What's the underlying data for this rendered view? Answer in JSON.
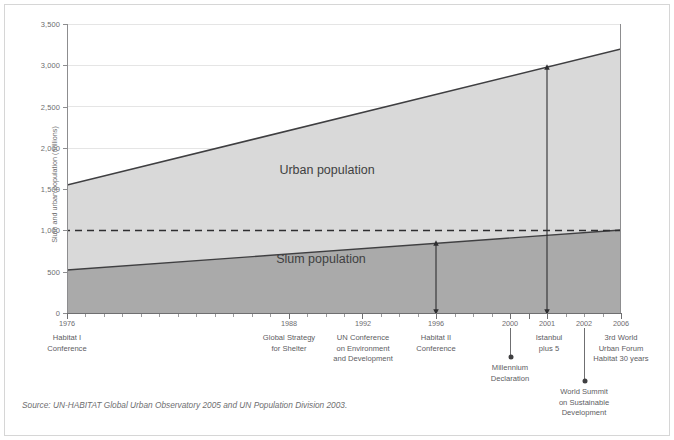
{
  "chart_data": {
    "type": "area",
    "title": "",
    "subtitle": "",
    "xlabel": "",
    "ylabel": "Slum and urban population (millions)",
    "xlim": [
      1976,
      2006
    ],
    "ylim": [
      0,
      3500
    ],
    "grid": true,
    "legend_position": "inline",
    "y_ticks": [
      0,
      500,
      1000,
      1500,
      2000,
      2500,
      3000,
      3500
    ],
    "y_tick_labels": [
      "0",
      "500",
      "1,000",
      "1,500",
      "2,000",
      "2,500",
      "3,000",
      "3,500"
    ],
    "x": [
      1976,
      2006
    ],
    "series": [
      {
        "name": "Urban population",
        "values": [
          1550,
          3200
        ]
      },
      {
        "name": "Slum population",
        "values": [
          520,
          1010
        ]
      }
    ],
    "reference_line": {
      "value": 1000,
      "style": "dashed",
      "label": ""
    },
    "annotations": [
      {
        "type": "vertical-arrow",
        "x": 1996,
        "from": 0,
        "to": 760,
        "note": "slum population at 1996"
      },
      {
        "type": "vertical-arrow",
        "x": 2002,
        "from": 0,
        "to": 3000,
        "note": "urban population at 2002"
      }
    ]
  },
  "axis": {
    "y_title": "Slum and urban population (millions)",
    "y_labels": [
      "3,500",
      "3,000",
      "2,500",
      "2,000",
      "1,500",
      "1,000",
      "500",
      "0"
    ],
    "x_year_labels": [
      "1976",
      "1988",
      "1992",
      "1996",
      "2000",
      "2001",
      "2002",
      "2006"
    ]
  },
  "series_labels": {
    "urban": "Urban population",
    "slum": "Slum population"
  },
  "milestones": [
    {
      "year": "1976",
      "lines": [
        "Habitat I",
        "Conference"
      ]
    },
    {
      "year": "1988",
      "lines": [
        "Global Strategy",
        "for Shelter"
      ]
    },
    {
      "year": "1992",
      "lines": [
        "UN Conference",
        "on Environment",
        "and Development"
      ]
    },
    {
      "year": "1996",
      "lines": [
        "Habitat II",
        "Conference"
      ]
    },
    {
      "year": "2001",
      "lines": [
        "Istanbul",
        "plus 5"
      ]
    },
    {
      "year": "2006",
      "lines": [
        "3rd World",
        "Urban Forum",
        "Habitat 30 years"
      ]
    }
  ],
  "callouts": [
    {
      "year": "2000",
      "lines": [
        "Millennium",
        "Declaration"
      ]
    },
    {
      "year": "2002",
      "lines": [
        "World Summit",
        "on Sustainable",
        "Development"
      ]
    }
  ],
  "source": "Source: UN-HABITAT Global Urban Observatory 2005 and UN Population Division 2003.",
  "colors": {
    "urban_fill": "#d9d9d9",
    "slum_fill": "#aaaaaa",
    "line": "#3f3f41",
    "grid": "#e3e3e3",
    "text": "#6e6e70",
    "border": "#d6d6d6"
  }
}
